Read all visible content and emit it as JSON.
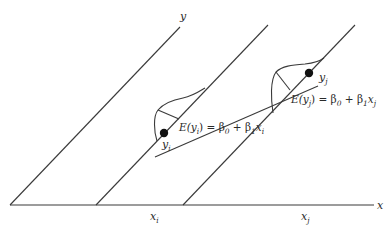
{
  "diagram": {
    "axes": {
      "x_label": "x",
      "y_label": "y"
    },
    "x_ticks": [
      {
        "base": "x",
        "sub": "i"
      },
      {
        "base": "x",
        "sub": "j"
      }
    ],
    "points": [
      {
        "base": "y",
        "sub": "i"
      },
      {
        "base": "y",
        "sub": "j"
      }
    ],
    "equations": [
      {
        "lhs": "E(y",
        "lhs_sub": "i",
        "mid": ") = β",
        "b0_sub": "0",
        "plus": " + β",
        "b1_sub": "1",
        "x": "x",
        "x_sub": "i"
      },
      {
        "lhs": "E(y",
        "lhs_sub": "j",
        "mid": ") = β",
        "b0_sub": "0",
        "plus": " + β",
        "b1_sub": "1",
        "x": "x",
        "x_sub": "j"
      }
    ],
    "colors": {
      "line": "#3a3a3a",
      "point": "#111111",
      "text": "#2a2a2a",
      "background": "#ffffff"
    }
  }
}
